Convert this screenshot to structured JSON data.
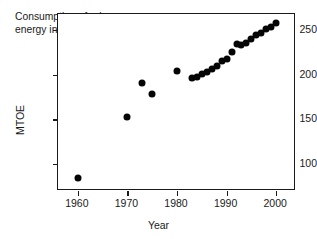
{
  "chart_data": {
    "type": "scatter",
    "title": "",
    "annotation": "Consumption of primary\nenergy in France",
    "xlabel": "Year",
    "ylabel": "MTOE",
    "xlim": [
      1956,
      2004
    ],
    "ylim": [
      70,
      268
    ],
    "xticks": [
      1960,
      1970,
      1980,
      1990,
      2000
    ],
    "yticks": [
      100,
      150,
      200,
      250
    ],
    "grid": false,
    "legend": null,
    "marker": "filled-circle",
    "marker_color": "#050505",
    "series": [
      {
        "name": "Consumption of primary energy in France",
        "x": [
          1960,
          1970,
          1973,
          1975,
          1980,
          1983,
          1984,
          1985,
          1986,
          1987,
          1988,
          1989,
          1990,
          1991,
          1992,
          1993,
          1994,
          1995,
          1996,
          1997,
          1998,
          1999,
          2000
        ],
        "values": [
          85,
          153,
          191,
          178,
          204,
          196,
          198,
          201,
          203,
          206,
          210,
          215,
          218,
          226,
          234,
          233,
          236,
          240,
          245,
          247,
          251,
          254,
          258
        ]
      }
    ]
  },
  "axes": {
    "x_tick_labels": [
      "1960",
      "1970",
      "1980",
      "1990",
      "2000"
    ],
    "y_tick_labels": [
      "100",
      "150",
      "200",
      "250"
    ]
  },
  "labels": {
    "x_axis_title": "Year",
    "y_axis_title": "MTOE",
    "annotation_line1": "Consumption of primary",
    "annotation_line2": "energy in France"
  },
  "colors": {
    "axis": "#1a1a1a",
    "marker": "#050505",
    "background": "#ffffff"
  }
}
